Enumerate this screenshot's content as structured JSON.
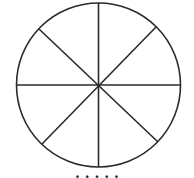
{
  "diagram": {
    "type": "circle-divided-into-sectors",
    "sectors": 8,
    "stroke_color": "#2a2a2a",
    "background": "#ffffff",
    "circle": {
      "cx": 98.5,
      "cy": 85,
      "r": 82
    },
    "spokes": [
      {
        "x1": 98.5,
        "y1": 3,
        "x2": 98.5,
        "y2": 167
      },
      {
        "x1": 16,
        "y1": 85,
        "x2": 181,
        "y2": 85
      },
      {
        "x1": 39,
        "y1": 29,
        "x2": 158,
        "y2": 142
      },
      {
        "x1": 156,
        "y1": 27,
        "x2": 42,
        "y2": 144
      }
    ]
  },
  "caption": {
    "text": "· · · · ·"
  }
}
